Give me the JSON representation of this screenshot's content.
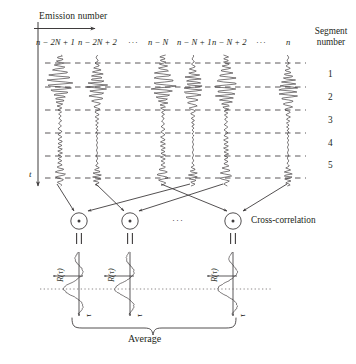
{
  "figure": {
    "background": "#ffffff",
    "ink": "#231f20",
    "width": 356,
    "height": 364
  },
  "top_axis": {
    "label": "Emission number",
    "arrow_direction": "right"
  },
  "time_axis": {
    "label": "t",
    "arrow_direction": "down"
  },
  "emission_columns": [
    {
      "label": "n − 2N + 1",
      "x": 60,
      "kind": "signal"
    },
    {
      "label": "n − 2N + 2",
      "x": 97,
      "kind": "signal"
    },
    {
      "label": "···",
      "x": 133,
      "kind": "ellipsis"
    },
    {
      "label": "n − N",
      "x": 163,
      "kind": "signal"
    },
    {
      "label": "n − N + 1",
      "x": 193,
      "kind": "signal"
    },
    {
      "label": "n − N + 2",
      "x": 226,
      "kind": "signal"
    },
    {
      "label": "···",
      "x": 258,
      "kind": "ellipsis"
    },
    {
      "label": "n",
      "x": 288,
      "kind": "signal"
    }
  ],
  "segment_header": "Segment number",
  "segments": [
    {
      "number": "1"
    },
    {
      "number": "2"
    },
    {
      "number": "3"
    },
    {
      "number": "4"
    },
    {
      "number": "5"
    }
  ],
  "correlation": {
    "operator_symbol": "⊙",
    "equals_symbol": "=",
    "label": "Cross-correlation",
    "ellipsis": "···",
    "nodes": [
      {
        "x": 79,
        "pair": [
          "n − 2N + 1",
          "n − N + 1"
        ]
      },
      {
        "x": 130,
        "pair": [
          "n − 2N + 2",
          "n − N + 2"
        ]
      },
      {
        "x": 233,
        "pair": [
          "n − N",
          "n"
        ]
      }
    ]
  },
  "result_plots": [
    {
      "x": 79,
      "y_label": "R(τ)",
      "x_label": "τ"
    },
    {
      "x": 130,
      "y_label": "R(τ)",
      "x_label": "τ"
    },
    {
      "x": 233,
      "y_label": "R(τ)",
      "x_label": "τ"
    }
  ],
  "average": {
    "label": "Average",
    "brace_from": 72,
    "brace_to": 236
  }
}
